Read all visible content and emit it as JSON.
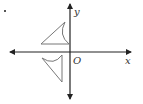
{
  "diagram": {
    "type": "coordinate-plane-reflection",
    "axes": {
      "x_label": "x",
      "y_label": "y",
      "origin_label": "O"
    },
    "shapes": [
      {
        "name": "upper-figure",
        "quadrant": "II",
        "description": "triangle with concave arc side"
      },
      {
        "name": "lower-figure",
        "quadrant": "III",
        "description": "rotated triangle with concave arc side"
      }
    ],
    "colors": {
      "axis": "#222222",
      "shape": "#777777",
      "background": "#ffffff"
    }
  }
}
